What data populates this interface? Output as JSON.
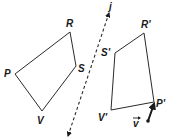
{
  "diagram": {
    "original": {
      "name": "PRSV",
      "vertices": [
        {
          "label": "P",
          "x": 15,
          "y": 74,
          "lx": 4,
          "ly": 77
        },
        {
          "label": "R",
          "x": 70,
          "y": 32,
          "lx": 66,
          "ly": 27
        },
        {
          "label": "S",
          "x": 76,
          "y": 66,
          "lx": 78,
          "ly": 72
        },
        {
          "label": "V",
          "x": 42,
          "y": 111,
          "lx": 37,
          "ly": 124
        }
      ]
    },
    "image": {
      "name": "P'R'S'V'",
      "vertices": [
        {
          "label": "P'",
          "x": 154,
          "y": 102,
          "lx": 156,
          "ly": 107
        },
        {
          "label": "R'",
          "x": 144,
          "y": 33,
          "lx": 141,
          "ly": 28
        },
        {
          "label": "S'",
          "x": 115,
          "y": 53,
          "lx": 101,
          "ly": 56
        },
        {
          "label": "V'",
          "x": 111,
          "y": 110,
          "lx": 98,
          "ly": 121
        }
      ]
    },
    "line": {
      "label": "j",
      "x1": 109,
      "y1": 13,
      "x2": 68,
      "y2": 136,
      "lx": 109,
      "ly": 10
    },
    "vector": {
      "label": "v",
      "x1": 148,
      "y1": 121,
      "x2": 154,
      "y2": 104,
      "lx": 133,
      "ly": 127
    }
  }
}
